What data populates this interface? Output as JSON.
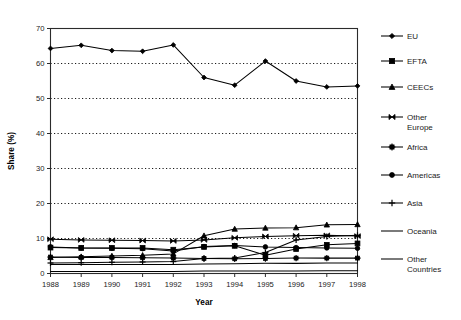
{
  "chart_data": {
    "type": "line",
    "title": "",
    "xlabel": "Year",
    "ylabel": "Share (%)",
    "x": [
      1988,
      1989,
      1990,
      1991,
      1992,
      1993,
      1994,
      1995,
      1996,
      1997,
      1998
    ],
    "xtick_labels": [
      "1988",
      "1989",
      "1990",
      "1991",
      "1992",
      "1993",
      "1994",
      "1995",
      "1996",
      "1997",
      "1998"
    ],
    "ytick_labels": [
      "0",
      "10",
      "20",
      "30",
      "40",
      "50",
      "60",
      "70"
    ],
    "yticks": [
      0,
      10,
      20,
      30,
      40,
      50,
      60,
      70
    ],
    "ylim": [
      0,
      70
    ],
    "grid": "horizontal-dotted",
    "legend_position": "right",
    "series": [
      {
        "name": "EU",
        "marker": "diamond",
        "values": [
          64.3,
          65.2,
          63.7,
          63.5,
          65.3,
          56.0,
          53.8,
          60.7,
          55.0,
          53.3,
          53.6
        ]
      },
      {
        "name": "EFTA",
        "marker": "square",
        "values": [
          7.4,
          7.3,
          7.3,
          7.3,
          6.8,
          7.6,
          7.9,
          5.2,
          7.0,
          8.2,
          8.6
        ]
      },
      {
        "name": "CEECs",
        "marker": "triangle",
        "values": [
          4.6,
          4.8,
          5.0,
          5.2,
          5.6,
          10.8,
          12.7,
          13.0,
          13.1,
          13.9,
          14.0
        ]
      },
      {
        "name": "Other Europe",
        "marker": "bowtie",
        "values": [
          9.8,
          9.6,
          9.5,
          9.4,
          9.3,
          9.6,
          10.2,
          10.6,
          10.8,
          10.9,
          10.7
        ]
      },
      {
        "name": "Africa",
        "marker": "asterisk",
        "values": [
          4.7,
          4.6,
          4.6,
          4.5,
          4.4,
          4.3,
          4.2,
          4.3,
          4.4,
          4.4,
          4.4
        ]
      },
      {
        "name": "Americas",
        "marker": "circle",
        "values": [
          7.6,
          7.3,
          7.2,
          7.1,
          6.4,
          7.7,
          8.0,
          7.6,
          7.4,
          7.3,
          7.2
        ]
      },
      {
        "name": "Asia",
        "marker": "plus",
        "values": [
          3.0,
          3.1,
          3.2,
          3.3,
          3.4,
          4.3,
          4.4,
          6.0,
          9.6,
          10.6,
          10.9
        ]
      },
      {
        "name": "Oceania",
        "marker": "dash",
        "values": [
          2.6,
          2.6,
          2.6,
          2.6,
          2.6,
          2.7,
          2.8,
          2.9,
          2.9,
          3.0,
          3.0
        ]
      },
      {
        "name": "Other Countries",
        "marker": "dash",
        "values": [
          0.6,
          0.6,
          0.6,
          0.6,
          0.6,
          0.7,
          0.7,
          0.7,
          0.7,
          0.8,
          0.8
        ]
      }
    ]
  },
  "legend": {
    "entries": [
      {
        "label": "EU"
      },
      {
        "label": "EFTA"
      },
      {
        "label": "CEECs"
      },
      {
        "label": "Other"
      },
      {
        "label": "Europe"
      },
      {
        "label": "Africa"
      },
      {
        "label": "Americas"
      },
      {
        "label": "Asia"
      },
      {
        "label": "Oceania"
      },
      {
        "label": "Other"
      },
      {
        "label": "Countries"
      }
    ]
  }
}
